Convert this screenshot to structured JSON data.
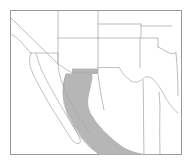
{
  "figure": {
    "kind": "distribution-range-map",
    "title": "",
    "caption": "",
    "width_px": 193,
    "height_px": 166,
    "background_color": "#ffffff"
  },
  "frame": {
    "x": 10,
    "y": 10,
    "width": 172,
    "height": 145,
    "stroke_color": "#9a9a9a",
    "fill_color": "#ffffff"
  },
  "legend": {
    "visible": false,
    "entries": [
      {
        "label": "shaded range",
        "color": "#b6b6b6"
      }
    ]
  },
  "map": {
    "region_name": "Southwestern United States and Northwestern Mexico",
    "boundary_color": "#a0a0a0",
    "coastline_color": "#a8a8a8",
    "shaded_range_color": "#b6b6b6",
    "features": {
      "land_outlines": [
        {
          "name": "california-nevada-diagonal",
          "d": "M 11 18 L 58 64"
        },
        {
          "name": "nevada-utah-vertical",
          "d": "M 58 11 L 58 64"
        },
        {
          "name": "utah-arizona-horizontal",
          "d": "M 58 38 L 98 38"
        },
        {
          "name": "arizona-newmexico-vertical",
          "d": "M 98 38 L 98 73"
        },
        {
          "name": "colorado-newmexico-top",
          "d": "M 98 38 L 140 38"
        },
        {
          "name": "newmexico-east-vertical",
          "d": "M 140 38 L 140 73"
        },
        {
          "name": "utah-colorado-vertical",
          "d": "M 98 11 L 98 38"
        },
        {
          "name": "wyoming-colorado-horizontal",
          "d": "M 98 22 L 140 22"
        },
        {
          "name": "colorado-kansas-vertical",
          "d": "M 140 22 L 140 38"
        },
        {
          "name": "kansas-oklahoma-north",
          "d": "M 140 25 L 172 25"
        },
        {
          "name": "oklahoma-texas-panhandle",
          "d": "M 140 38 L 158 38 L 158 50"
        },
        {
          "name": "red-river-oklahoma-texas",
          "d": "M 158 50 Q 166 55 174 52"
        },
        {
          "name": "california-coast",
          "d": "M 11 32 Q 18 36 22 42 Q 26 48 32 52 Q 38 56 44 60 Q 50 64 56 67"
        },
        {
          "name": "us-mexico-border-california-arizona",
          "d": "M 30 53 L 58 53 L 58 64 L 72 73 L 98 73"
        },
        {
          "name": "arizona-sonora-border",
          "d": "M 72 73 L 98 73 L 98 67 L 118 67"
        },
        {
          "name": "rio-grande-texas-mexico",
          "d": "M 118 67 Q 124 76 131 80 Q 138 83 143 79 Q 148 74 154 78 Q 160 84 164 92 Q 168 100 172 106"
        },
        {
          "name": "baja-california-peninsula-west",
          "d": "M 30 53 Q 28 60 30 66 Q 33 74 38 82 Q 44 92 50 102 Q 56 112 62 122 Q 67 131 71 138 Q 74 143 77 144 Q 80 144 80 141 Q 79 137 76 132 Q 71 124 65 114 Q 59 104 53 94 Q 47 84 42 75 Q 38 67 36 60 Q 35 55 34 53 Z"
        },
        {
          "name": "gulf-of-california-east-shore",
          "d": "M 58 64 Q 62 72 66 80 Q 71 90 77 99 Q 83 108 90 117 Q 96 125 102 132"
        },
        {
          "name": "sonora-sinaloa-coastline",
          "d": "M 72 73 Q 74 82 78 90 Q 83 100 89 110 Q 96 120 103 130 Q 109 139 115 148"
        },
        {
          "name": "chihuahua-coahuila-border",
          "d": "M 143 79 L 143 120 Q 143 132 144 143"
        },
        {
          "name": "coahuila-nuevoleon-border",
          "d": "M 158 92 Q 160 105 159 118 Q 159 132 160 145"
        },
        {
          "name": "texas-east-edge",
          "d": "M 174 52 Q 176 62 177 72 Q 178 82 178 92"
        }
      ],
      "shaded_range": {
        "name": "sonoran-desert-range",
        "description": "Shaded distribution range extending from the Arizona-Sonora border southeast along the Gulf of California coast",
        "d": "M 66 73 L 92 73 L 92 78 Q 91 86 89 94 Q 87 103 91 112 Q 96 121 104 130 Q 112 139 121 146 Q 131 152 142 154 L 160 154 L 158 147 Q 146 146 136 142 Q 125 137 116 129 Q 107 120 101 110 Q 96 101 96 92 Q 97 84 98 77 L 98 73 L 98 68 L 74 68 L 72 73 L 66 74 Q 63 80 62 88 Q 61 97 64 106 Q 67 115 72 124 Q 78 133 85 141 Q 92 148 99 153 L 112 154 Q 102 148 94 140 Q 86 131 80 121 Q 74 111 71 100 Q 68 89 68 80 Z"
      },
      "shaded_range_simple": {
        "name": "sonoran-desert-range-filled",
        "d": "M 66 73 L 92 73 L 92 76 Q 90 86 88 95 Q 86 104 90 113 Q 95 122 103 131 Q 112 140 122 147 Q 133 153 145 154 L 160 154 L 160 155 L 100 155 Q 90 148 82 138 Q 74 128 69 117 Q 64 105 63 93 Q 62 82 66 73 Z"
      }
    }
  }
}
